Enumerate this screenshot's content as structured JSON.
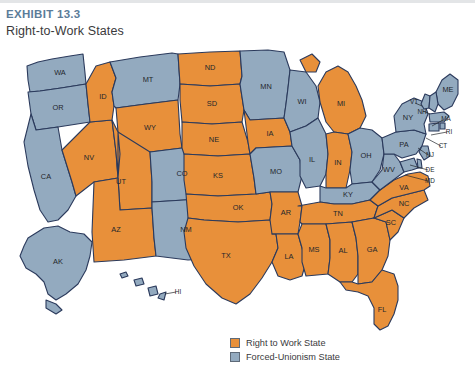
{
  "header": {
    "exhibit_label": "EXHIBIT 13.3",
    "title": "Right-to-Work States"
  },
  "legend": {
    "items": [
      {
        "label": "Right to Work State",
        "color": "#E8903A"
      },
      {
        "label": "Forced-Unionism State",
        "color": "#93AABF"
      }
    ]
  },
  "colors": {
    "right_to_work": "#E8903A",
    "forced_unionism": "#93AABF",
    "border": "#2b3a5c",
    "exhibit_label": "#5b7c99",
    "title": "#3a3a3c",
    "background": "#ffffff"
  },
  "caption": {
    "source": ""
  },
  "chart_data": {
    "type": "map",
    "title": "Right-to-Work States",
    "subtitle": "EXHIBIT 13.3",
    "legend_position": "bottom-center",
    "categories": [
      "Right to Work State",
      "Forced-Unionism State"
    ],
    "states": [
      {
        "code": "AL",
        "status": "Right to Work State"
      },
      {
        "code": "AK",
        "status": "Forced-Unionism State"
      },
      {
        "code": "AZ",
        "status": "Right to Work State"
      },
      {
        "code": "AR",
        "status": "Right to Work State"
      },
      {
        "code": "CA",
        "status": "Forced-Unionism State"
      },
      {
        "code": "CO",
        "status": "Forced-Unionism State"
      },
      {
        "code": "CT",
        "status": "Forced-Unionism State"
      },
      {
        "code": "DE",
        "status": "Forced-Unionism State"
      },
      {
        "code": "FL",
        "status": "Right to Work State"
      },
      {
        "code": "GA",
        "status": "Right to Work State"
      },
      {
        "code": "HI",
        "status": "Forced-Unionism State"
      },
      {
        "code": "ID",
        "status": "Right to Work State"
      },
      {
        "code": "IL",
        "status": "Forced-Unionism State"
      },
      {
        "code": "IN",
        "status": "Right to Work State"
      },
      {
        "code": "IA",
        "status": "Right to Work State"
      },
      {
        "code": "KS",
        "status": "Right to Work State"
      },
      {
        "code": "KY",
        "status": "Forced-Unionism State"
      },
      {
        "code": "LA",
        "status": "Right to Work State"
      },
      {
        "code": "ME",
        "status": "Forced-Unionism State"
      },
      {
        "code": "MD",
        "status": "Forced-Unionism State"
      },
      {
        "code": "MA",
        "status": "Forced-Unionism State"
      },
      {
        "code": "MI",
        "status": "Right to Work State"
      },
      {
        "code": "MN",
        "status": "Forced-Unionism State"
      },
      {
        "code": "MS",
        "status": "Right to Work State"
      },
      {
        "code": "MO",
        "status": "Forced-Unionism State"
      },
      {
        "code": "MT",
        "status": "Forced-Unionism State"
      },
      {
        "code": "NE",
        "status": "Right to Work State"
      },
      {
        "code": "NV",
        "status": "Right to Work State"
      },
      {
        "code": "NH",
        "status": "Forced-Unionism State"
      },
      {
        "code": "NJ",
        "status": "Forced-Unionism State"
      },
      {
        "code": "NM",
        "status": "Forced-Unionism State"
      },
      {
        "code": "NY",
        "status": "Forced-Unionism State"
      },
      {
        "code": "NC",
        "status": "Right to Work State"
      },
      {
        "code": "ND",
        "status": "Right to Work State"
      },
      {
        "code": "OH",
        "status": "Forced-Unionism State"
      },
      {
        "code": "OK",
        "status": "Right to Work State"
      },
      {
        "code": "OR",
        "status": "Forced-Unionism State"
      },
      {
        "code": "PA",
        "status": "Forced-Unionism State"
      },
      {
        "code": "RI",
        "status": "Forced-Unionism State"
      },
      {
        "code": "SC",
        "status": "Right to Work State"
      },
      {
        "code": "SD",
        "status": "Right to Work State"
      },
      {
        "code": "TN",
        "status": "Right to Work State"
      },
      {
        "code": "TX",
        "status": "Right to Work State"
      },
      {
        "code": "UT",
        "status": "Right to Work State"
      },
      {
        "code": "VT",
        "status": "Forced-Unionism State"
      },
      {
        "code": "VA",
        "status": "Right to Work State"
      },
      {
        "code": "WA",
        "status": "Forced-Unionism State"
      },
      {
        "code": "WV",
        "status": "Forced-Unionism State"
      },
      {
        "code": "WI",
        "status": "Forced-Unionism State"
      },
      {
        "code": "WY",
        "status": "Right to Work State"
      }
    ],
    "counts": {
      "right_to_work": 24,
      "forced_unionism": 26
    }
  }
}
